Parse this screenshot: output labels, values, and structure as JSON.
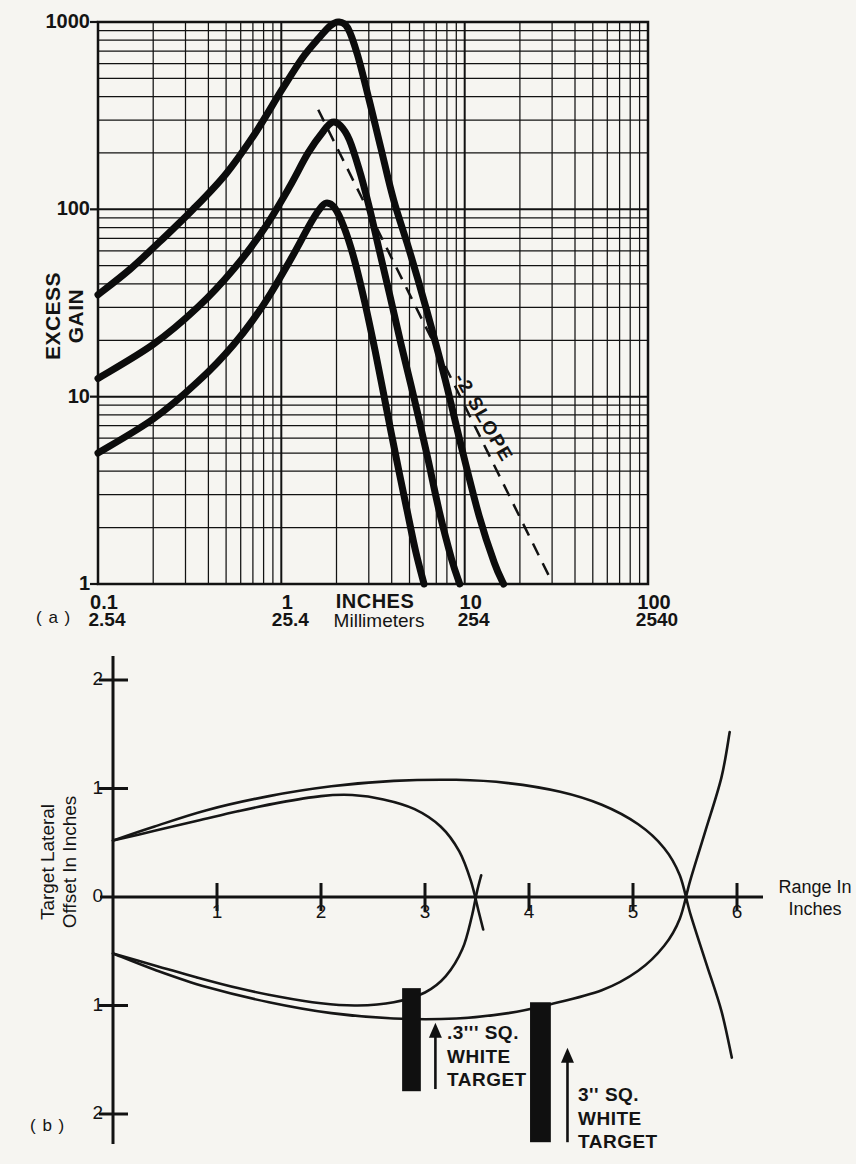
{
  "page": {
    "background": "#f6f5f1",
    "ink": "#121212"
  },
  "chart_data": [
    {
      "id": "excess-gain-vs-range",
      "type": "line",
      "panel_label": "( a )",
      "x_scale": "log",
      "y_scale": "log",
      "xlim": [
        0.1,
        100
      ],
      "ylim": [
        1,
        1000
      ],
      "grid": "log-log, minor lines at 2-9 each decade",
      "legend_position": "none",
      "ylabel": "EXCESS GAIN",
      "ylabel_lines": [
        "EXCESS",
        "GAIN"
      ],
      "xlabel_primary": "INCHES",
      "xlabel_secondary": "Millimeters",
      "y_tick_values": [
        1000,
        100,
        10,
        1
      ],
      "y_tick_labels": [
        "1000",
        "100",
        "10",
        "1"
      ],
      "x_tick_values": [
        0.1,
        1,
        10,
        100
      ],
      "x_ticks": [
        {
          "inches": "0.1",
          "mm": "2.54"
        },
        {
          "inches": "1",
          "mm": "25.4"
        },
        {
          "inches": "10",
          "mm": "254"
        },
        {
          "inches": "100",
          "mm": "2540"
        }
      ],
      "series": [
        {
          "name": "high-gain-curve-peak-1000",
          "points": [
            [
              0.1,
              35
            ],
            [
              0.15,
              48
            ],
            [
              0.22,
              68
            ],
            [
              0.33,
              100
            ],
            [
              0.5,
              155
            ],
            [
              0.72,
              255
            ],
            [
              1.0,
              430
            ],
            [
              1.3,
              640
            ],
            [
              1.6,
              820
            ],
            [
              1.85,
              955
            ],
            [
              2.05,
              1000
            ],
            [
              2.3,
              930
            ],
            [
              2.6,
              670
            ],
            [
              3.0,
              390
            ],
            [
              3.5,
              210
            ],
            [
              4.1,
              112
            ],
            [
              5.0,
              60
            ],
            [
              6.2,
              29
            ],
            [
              7.8,
              12.5
            ],
            [
              9.6,
              5.4
            ],
            [
              12,
              2.3
            ],
            [
              14.5,
              1.3
            ],
            [
              16.3,
              1.0
            ]
          ]
        },
        {
          "name": "mid-gain-curve-peak-300",
          "points": [
            [
              0.1,
              12.5
            ],
            [
              0.2,
              19
            ],
            [
              0.35,
              30
            ],
            [
              0.55,
              48
            ],
            [
              0.8,
              78
            ],
            [
              1.1,
              130
            ],
            [
              1.4,
              200
            ],
            [
              1.7,
              262
            ],
            [
              1.9,
              292
            ],
            [
              2.1,
              280
            ],
            [
              2.35,
              235
            ],
            [
              2.65,
              165
            ],
            [
              3.0,
              105
            ],
            [
              3.4,
              62
            ],
            [
              3.9,
              35
            ],
            [
              4.5,
              19
            ],
            [
              5.3,
              9.8
            ],
            [
              6.2,
              5.0
            ],
            [
              7.3,
              2.4
            ],
            [
              8.5,
              1.35
            ],
            [
              9.4,
              1.0
            ]
          ]
        },
        {
          "name": "low-gain-curve-peak-110",
          "points": [
            [
              0.1,
              5
            ],
            [
              0.2,
              7.6
            ],
            [
              0.35,
              12
            ],
            [
              0.55,
              19
            ],
            [
              0.8,
              31
            ],
            [
              1.1,
              52
            ],
            [
              1.4,
              80
            ],
            [
              1.6,
              99
            ],
            [
              1.75,
              108
            ],
            [
              1.95,
              102
            ],
            [
              2.2,
              80
            ],
            [
              2.5,
              54
            ],
            [
              2.85,
              32
            ],
            [
              3.25,
              17.5
            ],
            [
              3.7,
              9.2
            ],
            [
              4.2,
              4.9
            ],
            [
              4.8,
              2.6
            ],
            [
              5.4,
              1.5
            ],
            [
              6.0,
              1.0
            ]
          ]
        }
      ],
      "reference_line": {
        "label": "-2 SLOPE",
        "style": "dashed",
        "slope": -2,
        "points": [
          [
            1.59,
            340
          ],
          [
            30,
            1.02
          ]
        ]
      }
    },
    {
      "id": "beam-pattern",
      "type": "line",
      "panel_label": "( b )",
      "x_scale": "linear",
      "y_scale": "linear",
      "xlim": [
        0,
        6.3
      ],
      "ylim": [
        -2.3,
        2.3
      ],
      "grid": "off",
      "legend_position": "none",
      "xlabel_lines": [
        "Range In",
        "Inches"
      ],
      "ylabel_lines": [
        "Target Lateral",
        "Offset In Inches"
      ],
      "x_tick_values": [
        1,
        2,
        3,
        4,
        5,
        6
      ],
      "x_tick_labels": [
        "1",
        "2",
        "3",
        "4",
        "5",
        "6"
      ],
      "y_tick_values": [
        2,
        1,
        0,
        -1,
        -2
      ],
      "y_tick_labels": [
        "2",
        "1",
        "0",
        "1",
        "2"
      ],
      "series": [
        {
          "name": "small-target-lobe-upper",
          "points": [
            [
              0,
              0.52
            ],
            [
              0.4,
              0.61
            ],
            [
              0.8,
              0.7
            ],
            [
              1.2,
              0.79
            ],
            [
              1.6,
              0.87
            ],
            [
              2.0,
              0.93
            ],
            [
              2.3,
              0.94
            ],
            [
              2.6,
              0.9
            ],
            [
              2.9,
              0.81
            ],
            [
              3.15,
              0.65
            ],
            [
              3.33,
              0.42
            ],
            [
              3.44,
              0.15
            ],
            [
              3.52,
              -0.15
            ],
            [
              3.56,
              -0.3
            ]
          ]
        },
        {
          "name": "small-target-lobe-lower",
          "points": [
            [
              0,
              -0.52
            ],
            [
              0.4,
              -0.63
            ],
            [
              0.8,
              -0.74
            ],
            [
              1.2,
              -0.84
            ],
            [
              1.6,
              -0.92
            ],
            [
              2.0,
              -0.98
            ],
            [
              2.35,
              -1.0
            ],
            [
              2.7,
              -0.97
            ],
            [
              3.0,
              -0.88
            ],
            [
              3.2,
              -0.73
            ],
            [
              3.36,
              -0.48
            ],
            [
              3.45,
              -0.18
            ],
            [
              3.5,
              0.05
            ],
            [
              3.54,
              0.2
            ]
          ]
        },
        {
          "name": "large-target-lobe-upper",
          "points": [
            [
              0,
              0.52
            ],
            [
              0.4,
              0.65
            ],
            [
              0.9,
              0.8
            ],
            [
              1.5,
              0.93
            ],
            [
              2.1,
              1.02
            ],
            [
              2.7,
              1.07
            ],
            [
              3.3,
              1.08
            ],
            [
              3.8,
              1.05
            ],
            [
              4.3,
              0.97
            ],
            [
              4.7,
              0.85
            ],
            [
              5.05,
              0.67
            ],
            [
              5.3,
              0.45
            ],
            [
              5.45,
              0.2
            ],
            [
              5.55,
              -0.15
            ],
            [
              5.7,
              -0.6
            ],
            [
              5.85,
              -1.05
            ],
            [
              5.95,
              -1.48
            ]
          ]
        },
        {
          "name": "large-target-lobe-lower",
          "points": [
            [
              0,
              -0.52
            ],
            [
              0.4,
              -0.67
            ],
            [
              0.9,
              -0.83
            ],
            [
              1.5,
              -0.97
            ],
            [
              2.1,
              -1.07
            ],
            [
              2.7,
              -1.12
            ],
            [
              3.3,
              -1.12
            ],
            [
              3.8,
              -1.07
            ],
            [
              4.2,
              -0.99
            ],
            [
              4.7,
              -0.86
            ],
            [
              5.05,
              -0.68
            ],
            [
              5.3,
              -0.45
            ],
            [
              5.45,
              -0.2
            ],
            [
              5.55,
              0.15
            ],
            [
              5.7,
              0.62
            ],
            [
              5.85,
              1.1
            ],
            [
              5.93,
              1.52
            ]
          ]
        }
      ],
      "axis_crossings": [
        3.5,
        5.5
      ],
      "annotations": [
        {
          "name": "small-target",
          "lines": [
            ".3''' SQ.",
            "WHITE",
            "TARGET"
          ],
          "bar": {
            "x": [
              2.78,
              2.96
            ],
            "y": [
              -0.84,
              -1.79
            ]
          },
          "arrow": {
            "x": 3.1,
            "y_tail": -1.77,
            "y_tip": -1.16
          }
        },
        {
          "name": "large-target",
          "lines": [
            "3'' SQ.",
            "WHITE",
            "TARGET"
          ],
          "bar": {
            "x": [
              4.01,
              4.21
            ],
            "y": [
              -0.97,
              -2.26
            ]
          },
          "arrow": {
            "x": 4.37,
            "y_tail": -2.26,
            "y_tip": -1.39
          }
        }
      ]
    }
  ]
}
